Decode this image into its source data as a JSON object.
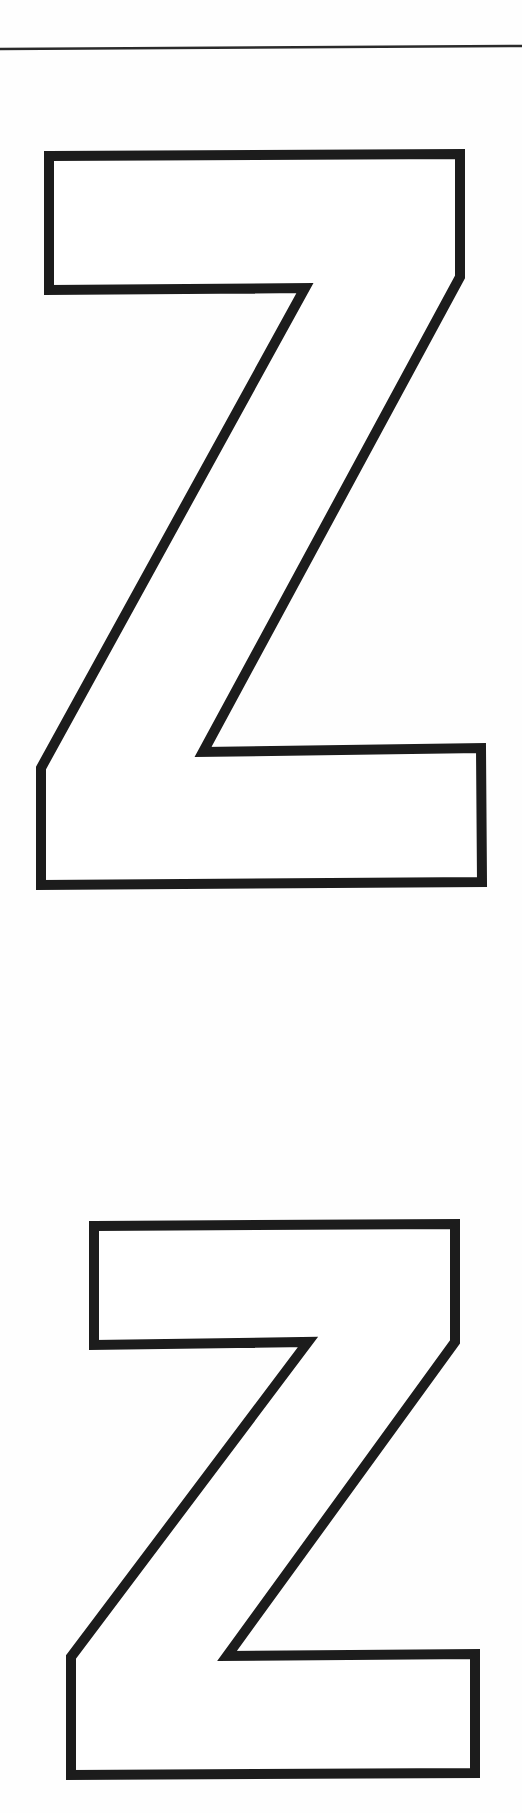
{
  "page": {
    "background": "#fefefe",
    "ink_color": "#1c1c1c"
  },
  "rule_line": {
    "y": 48,
    "thickness": 2
  },
  "letters": [
    {
      "glyph": "Z",
      "label": "Z",
      "style": "outline",
      "stroke_width": 10
    },
    {
      "glyph": "Z",
      "label": "Z",
      "style": "outline",
      "stroke_width": 10
    }
  ]
}
